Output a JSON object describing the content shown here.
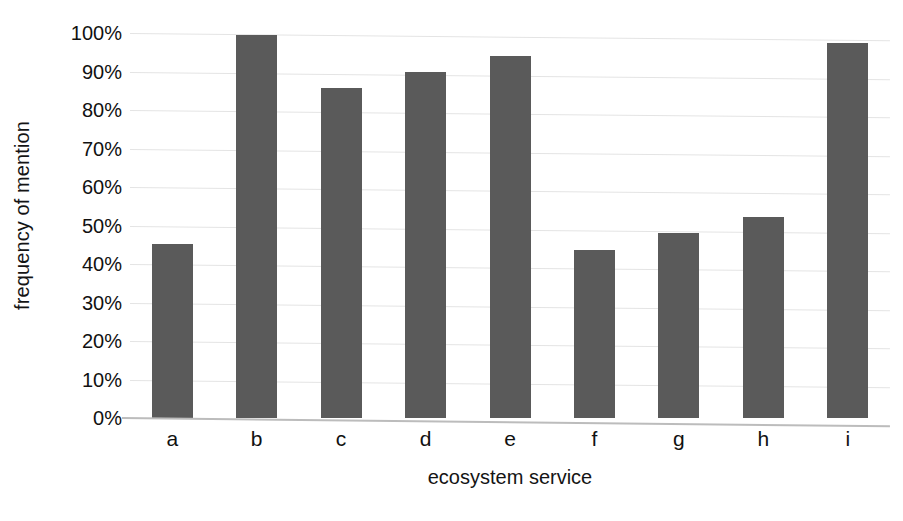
{
  "chart_data": {
    "type": "bar",
    "title": "",
    "subtitle": "",
    "xlabel": "ecosystem service",
    "ylabel": "frequency of mention",
    "categories": [
      "a",
      "b",
      "c",
      "d",
      "e",
      "f",
      "g",
      "h",
      "i"
    ],
    "values": [
      45.3,
      99.5,
      85.6,
      89.9,
      94.0,
      43.6,
      48.0,
      52.2,
      97.5
    ],
    "value_labels": [
      "45%",
      "100%",
      "86%",
      "90%",
      "94%",
      "44%",
      "48%",
      "52%",
      "98%"
    ],
    "ylim": [
      0,
      100
    ],
    "ytick_values": [
      0,
      10,
      20,
      30,
      40,
      50,
      60,
      70,
      80,
      90,
      100
    ],
    "ytick_labels": [
      "0%",
      "10%",
      "20%",
      "30%",
      "40%",
      "50%",
      "60%",
      "70%",
      "80%",
      "90%",
      "100%"
    ],
    "grid": true,
    "grid_axis": "y",
    "legend": false,
    "legend_position": "none",
    "bar_color": "#5a5a5a",
    "gridline_color": "#e4e4e4",
    "axis_color": "#bcbcbc",
    "background_color": "#ffffff",
    "annotations": []
  },
  "axes": {
    "y_title": "frequency of mention",
    "x_title": "ecosystem service"
  }
}
